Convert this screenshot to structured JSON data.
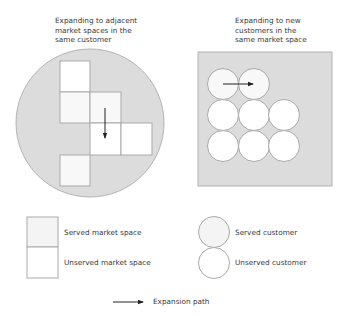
{
  "left_panel": {
    "title": "Expanding to adjacent\nmarket spaces in the\nsame customer"
  },
  "right_panel": {
    "title": "Expanding to new\ncustomers in the\nsame market space"
  },
  "legend": {
    "served_market_space": "Served market space",
    "unserved_market_space": "Unserved market space",
    "served_customer": "Served customer",
    "unserved_customer": "Unserved customer",
    "expansion_path": "Expansion path"
  },
  "colors": {
    "background_fill": "#dcdcdc",
    "served_fill": "#f4f4f4",
    "unserved_fill": "#ffffff",
    "outline": "#a9a9a9",
    "arrow": "#222222"
  }
}
